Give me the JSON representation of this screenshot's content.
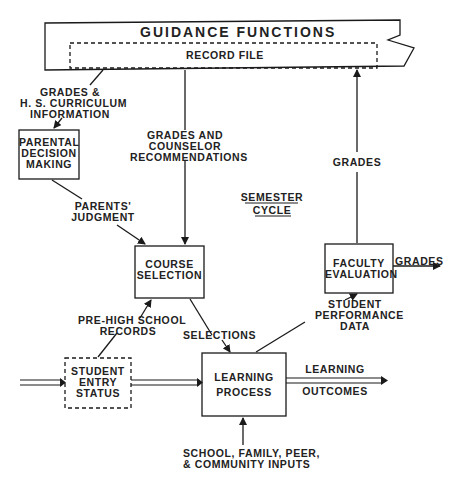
{
  "diagram": {
    "header": {
      "title": "GUIDANCE FUNCTIONS",
      "subtitle": "RECORD FILE"
    },
    "nodes": {
      "parental": [
        "PARENTAL",
        "DECISION",
        "MAKING"
      ],
      "course": [
        "COURSE",
        "SELECTION"
      ],
      "faculty": [
        "FACULTY",
        "EVALUATION"
      ],
      "entry": [
        "STUDENT",
        "ENTRY",
        "STATUS"
      ],
      "learning": [
        "LEARNING",
        "PROCESS"
      ]
    },
    "edges": {
      "grades_hs": [
        "GRADES &",
        "H. S. CURRICULUM",
        "INFORMATION"
      ],
      "grades_counselor": [
        "GRADES AND",
        "COUNSELOR",
        "RECOMMENDATIONS"
      ],
      "parents_judgment": [
        "PARENTS'",
        "JUDGMENT"
      ],
      "grades_up": "GRADES",
      "grades_out": "GRADES",
      "pre_hs": [
        "PRE-HIGH SCHOOL",
        "RECORDS"
      ],
      "selections": "SELECTIONS",
      "perf_data": [
        "STUDENT",
        "PERFORMANCE",
        "DATA"
      ],
      "learning_outcomes_1": "LEARNING",
      "learning_outcomes_2": "OUTCOMES",
      "inputs": [
        "SCHOOL, FAMILY, PEER,",
        "& COMMUNITY INPUTS"
      ]
    },
    "cycle": [
      "SEMESTER",
      "CYCLE"
    ]
  }
}
